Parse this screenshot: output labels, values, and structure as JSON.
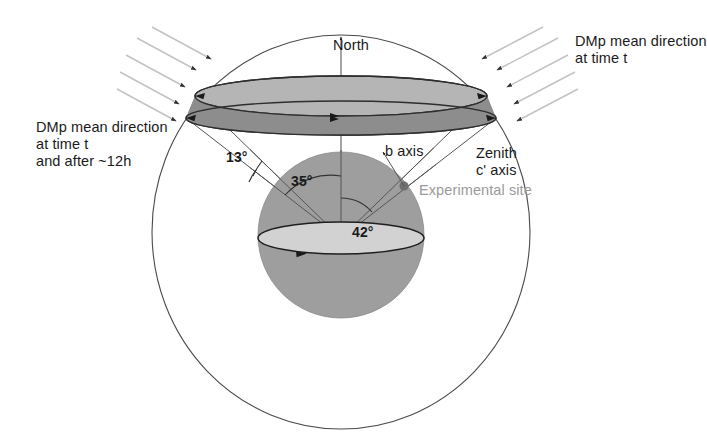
{
  "figure": {
    "type": "geometric-orientation-diagram",
    "background_color": "#ffffff"
  },
  "labels": {
    "north": "North",
    "dmp_right": "DMp mean direction\nat time t",
    "dmp_left": "DMp mean direction\nat time t\nand after ~12h",
    "b_axis": "b axis",
    "zenith": "Zenith\nc' axis",
    "experimental_site": "Experimental site"
  },
  "angles": {
    "cone_half_spread": "13°",
    "upper_cone": "35°",
    "lower_cone": "42°"
  },
  "colors": {
    "outline": "#3a3a3a",
    "sphere_fill": "#9e9e9e",
    "band_upper_fill": "#b5b5b5",
    "band_lower_fill": "#8d8d8d",
    "equator_fill": "#d2d2d2",
    "arrow_gray": "#bdbdbd",
    "site_label_gray": "#9a9a9a",
    "site_dot": "#707070"
  },
  "geometry": {
    "outer_ellipse": {
      "cx": 341,
      "cy": 232,
      "rx": 189,
      "ry": 197
    },
    "sphere": {
      "cx": 341,
      "cy": 235,
      "r": 83
    },
    "band_upper_ellipse": {
      "cx": 341,
      "cy": 96,
      "rx": 146,
      "ry": 20
    },
    "band_lower_ellipse": {
      "cx": 341,
      "cy": 118,
      "rx": 155,
      "ry": 17
    },
    "equator_ellipse": {
      "cx": 341,
      "cy": 238,
      "rx": 83,
      "ry": 16
    },
    "experimental_site_point": {
      "x": 404,
      "y": 186
    }
  },
  "arrow_groups": {
    "left": {
      "count": 5,
      "direction": "down-right",
      "target": "band-left-edge"
    },
    "right": {
      "count": 5,
      "direction": "down-left",
      "target": "band-right-edge"
    }
  }
}
